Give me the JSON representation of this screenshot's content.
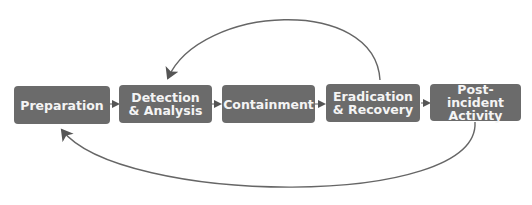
{
  "diagram": {
    "type": "incident-response-lifecycle",
    "colors": {
      "box_fill": "#6b6b6b",
      "box_text": "#f4f4f4",
      "arrow": "#6e6e6e",
      "background": "#ffffff"
    },
    "steps": [
      {
        "label": "Preparation"
      },
      {
        "label": "Detection & Analysis"
      },
      {
        "label": "Containment"
      },
      {
        "label": "Eradication & Recovery"
      },
      {
        "label": "Post-incident Activity"
      }
    ],
    "feedback_arrows": [
      {
        "from": "Eradication & Recovery",
        "to": "Detection & Analysis",
        "position": "top"
      },
      {
        "from": "Post-incident Activity",
        "to": "Preparation",
        "position": "bottom"
      }
    ]
  }
}
